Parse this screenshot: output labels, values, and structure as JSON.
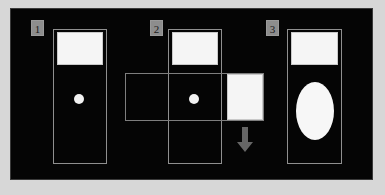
{
  "figure": {
    "title": "",
    "background_color": "#050505",
    "margin_color": "#d7d7d7",
    "outline_color": "#8f8f8f",
    "fill_color": "#f5f5f5",
    "badge_color": "#8d8d8d",
    "arrow_color": "#6e6e6e"
  },
  "panels": [
    {
      "badge": "1",
      "elements": {
        "container_label": "vertical-outlined-rectangle",
        "top_block_label": "white-filled-rectangle",
        "marker_label": "small-white-circle"
      }
    },
    {
      "badge": "2",
      "elements": {
        "container_label": "vertical-outlined-rectangle",
        "top_block_label": "white-filled-rectangle",
        "marker_label": "small-white-circle",
        "overlay_label": "wide-horizontal-outlined-rectangle",
        "side_block_label": "white-filled-rectangle",
        "arrow_label": "down-arrow"
      }
    },
    {
      "badge": "3",
      "elements": {
        "container_label": "vertical-outlined-rectangle",
        "top_block_label": "white-filled-rectangle",
        "marker_label": "large-white-ellipse"
      }
    }
  ]
}
